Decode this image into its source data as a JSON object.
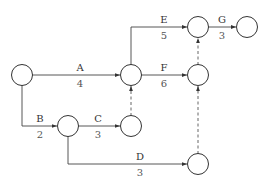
{
  "diagram": {
    "type": "activity-on-arrow network",
    "activities": [
      {
        "name": "A",
        "duration": "4"
      },
      {
        "name": "B",
        "duration": "2"
      },
      {
        "name": "C",
        "duration": "3"
      },
      {
        "name": "D",
        "duration": "3"
      },
      {
        "name": "E",
        "duration": "5"
      },
      {
        "name": "F",
        "duration": "6"
      },
      {
        "name": "G",
        "duration": "3"
      }
    ],
    "dummy_count": 3
  }
}
